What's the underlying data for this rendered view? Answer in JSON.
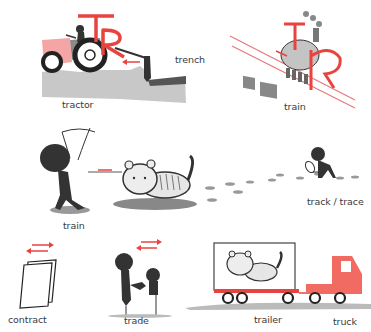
{
  "colors": {
    "accent_red": "#e8433f",
    "soft_red": "#f0a0a0",
    "truck_red": "#f26b63",
    "silhouette": "#333333",
    "ground_gray": "#c8c8c8",
    "tiger_gray": "#d9d9d9",
    "text": "#3a3a3a"
  },
  "scenes": [
    {
      "id": "tractor",
      "label": "tractor",
      "letters": "TR"
    },
    {
      "id": "trench",
      "label": "trench"
    },
    {
      "id": "train-locomotive",
      "label": "train",
      "letters": "TR"
    },
    {
      "id": "train-tiger",
      "label": "train"
    },
    {
      "id": "track-trace",
      "label": "track / trace"
    },
    {
      "id": "contract",
      "label": "contract"
    },
    {
      "id": "trade",
      "label": "trade"
    },
    {
      "id": "trailer",
      "label": "trailer"
    },
    {
      "id": "truck",
      "label": "truck"
    }
  ],
  "icons": {
    "arrow_pair": "double-arrow-icon",
    "magnifier": "magnifying-glass-icon"
  }
}
